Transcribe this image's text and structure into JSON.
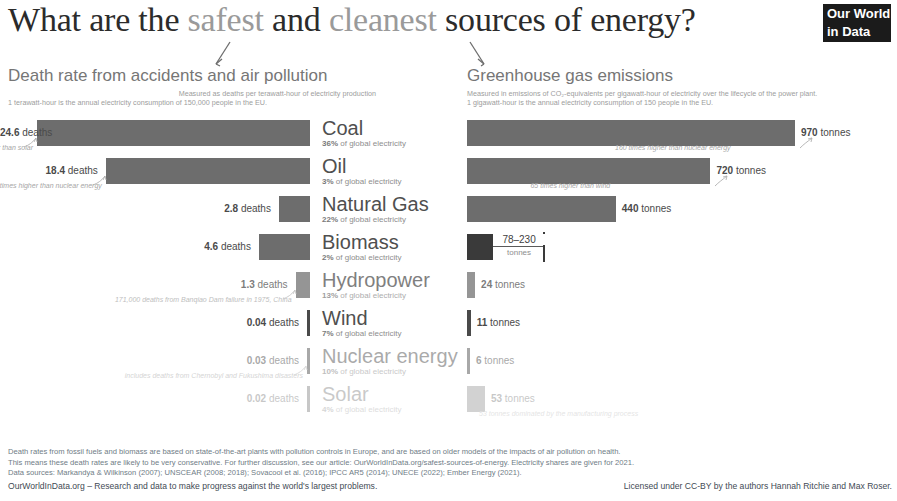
{
  "header": {
    "title_part1": "What are the ",
    "title_hl1": "safest",
    "title_part2": " and ",
    "title_hl2": "cleanest",
    "title_part3": " sources of energy?",
    "logo_line1": "Our World",
    "logo_line2": "in Data"
  },
  "left_panel": {
    "title": "Death rate from accidents and air pollution",
    "sub1": "Measured as deaths per terawatt-hour of electricity production",
    "sub2": "1 terawatt-hour is the annual electricity consumption of 150,000 people in the EU."
  },
  "right_panel": {
    "title": "Greenhouse gas emissions",
    "sub1": "Measured in emissions of CO₂-equivalents per gigawatt-hour of electricity over the lifecycle of the power plant.",
    "sub2": "1 gigawatt-hour is the annual electricity consumption of 150 people in the EU."
  },
  "units": {
    "deaths": "deaths",
    "tonnes": "tonnes"
  },
  "chart_data": {
    "type": "bar",
    "title": "What are the safest and cleanest sources of energy?",
    "categories": [
      "Coal",
      "Oil",
      "Natural Gas",
      "Biomass",
      "Hydropower",
      "Wind",
      "Nuclear energy",
      "Solar"
    ],
    "series": [
      {
        "name": "Death rate from accidents and air pollution (deaths per TWh)",
        "unit": "deaths",
        "values": [
          24.6,
          18.4,
          2.8,
          4.6,
          1.3,
          0.04,
          0.03,
          0.02
        ]
      },
      {
        "name": "Greenhouse gas emissions (tonnes CO₂eq per GWh)",
        "unit": "tonnes",
        "values": [
          970,
          720,
          440,
          230,
          24,
          11,
          6,
          53
        ]
      }
    ],
    "share_of_global_electricity": [
      "36%",
      "3%",
      "22%",
      "2%",
      "13%",
      "7%",
      "10%",
      "4%"
    ],
    "grid": false,
    "legend": "none"
  },
  "rows": [
    {
      "name": "Coal",
      "pct": "36%",
      "pct_suffix": " of global electricity",
      "deaths": "24.6",
      "deaths_unit": "deaths",
      "death_note": "1230 times higher than solar",
      "tonnes": "970",
      "tonnes_unit": "tonnes",
      "emission_note": "160 times higher than nuclear energy"
    },
    {
      "name": "Oil",
      "pct": "3%",
      "pct_suffix": " of global electricity",
      "deaths": "18.4",
      "deaths_unit": "deaths",
      "death_note": "612 times higher than nuclear energy",
      "tonnes": "720",
      "tonnes_unit": "tonnes",
      "emission_note": "65 times higher than wind"
    },
    {
      "name": "Natural Gas",
      "pct": "22%",
      "pct_suffix": " of global electricity",
      "deaths": "2.8",
      "deaths_unit": "deaths",
      "death_note": "",
      "tonnes": "440",
      "tonnes_unit": "tonnes",
      "emission_note": ""
    },
    {
      "name": "Biomass",
      "pct": "2%",
      "pct_suffix": " of global electricity",
      "deaths": "4.6",
      "deaths_unit": "deaths",
      "death_note": "",
      "tonnes": "78–230",
      "tonnes_unit": "tonnes",
      "emission_note": ""
    },
    {
      "name": "Hydropower",
      "pct": "13%",
      "pct_suffix": " of global electricity",
      "deaths": "1.3",
      "deaths_unit": "deaths",
      "death_note": "171,000 deaths from Banqiao Dam failure in 1975, China",
      "tonnes": "24",
      "tonnes_unit": "tonnes",
      "emission_note": ""
    },
    {
      "name": "Wind",
      "pct": "7%",
      "pct_suffix": " of global electricity",
      "deaths": "0.04",
      "deaths_unit": "deaths",
      "death_note": "",
      "tonnes": "11",
      "tonnes_unit": "tonnes",
      "emission_note": ""
    },
    {
      "name": "Nuclear energy",
      "pct": "10%",
      "pct_suffix": " of global electricity",
      "deaths": "0.03",
      "deaths_unit": "deaths",
      "death_note": "includes deaths from Chernobyl and Fukushima disasters",
      "tonnes": "6",
      "tonnes_unit": "tonnes",
      "emission_note": ""
    },
    {
      "name": "Solar",
      "pct": "4%",
      "pct_suffix": " of global electricity",
      "deaths": "0.02",
      "deaths_unit": "deaths",
      "death_note": "",
      "tonnes": "53",
      "tonnes_unit": "tonnes",
      "emission_note": "53 tonnes dominated by the manufacturing process"
    }
  ],
  "footer": {
    "line1": "Death rates from fossil fuels and biomass are based on state-of-the-art plants with pollution controls in Europe, and are based on older models of the impacts of air pollution on health.",
    "line2": "This means these death rates are likely to be very conservative. For further discussion, see our article: OurWorldInData.org/safest-sources-of-energy. Electricity shares are given for 2021.",
    "line3": "Data sources: Markandya & Wilkinson (2007); UNSCEAR (2008; 2018); Sovacool et al. (2016); IPCC AR5 (2014); UNECE (2022); Ember Energy (2021).",
    "left": "OurWorldInData.org – Research and data to make progress against the world's largest problems.",
    "right": "Licensed under CC-BY by the authors Hannah Ritchie and Max Roser."
  }
}
